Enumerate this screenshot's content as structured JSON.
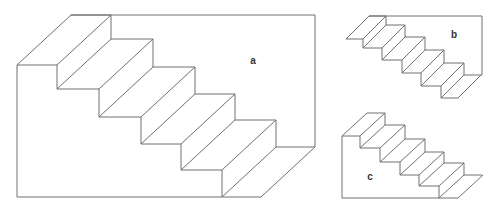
{
  "figures": [
    {
      "id": "a",
      "label": "a",
      "label_pos": [
        253,
        61
      ],
      "depth": [
        54,
        -50
      ],
      "front_x": [
        17,
        57,
        99,
        141,
        181,
        222
      ],
      "front_y": [
        65,
        89,
        117,
        144,
        170,
        197
      ],
      "back_right_x": 315,
      "floor_end_x": 261,
      "front_left_bottom_y": 197,
      "has_left_wall": true,
      "has_back_wall": true
    },
    {
      "id": "b",
      "label": "b",
      "label_pos": [
        454,
        35
      ],
      "depth": [
        23,
        -23
      ],
      "front_x": [
        346,
        363,
        382,
        402,
        421,
        441
      ],
      "front_y": [
        39,
        48,
        60,
        73,
        86,
        98
      ],
      "back_right_x": 482,
      "floor_end_x": 458,
      "has_left_wall": false,
      "has_back_wall": true
    },
    {
      "id": "c",
      "label": "c",
      "label_pos": [
        370,
        177
      ],
      "depth": [
        25,
        -23
      ],
      "front_x": [
        342,
        360,
        380,
        400,
        419,
        439
      ],
      "front_y": [
        136,
        148,
        162,
        175,
        186,
        198
      ],
      "back_right_x": 482,
      "floor_end_x": 458,
      "front_left_bottom_y": 198,
      "has_left_wall": true,
      "has_back_wall": false
    }
  ],
  "style": {
    "line_color": "#707070",
    "label_color": "#333333"
  }
}
